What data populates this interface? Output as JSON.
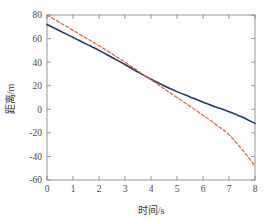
{
  "chart_data": {
    "type": "line",
    "title": "",
    "xlabel": "时间/s",
    "ylabel": "距离/m",
    "xlim": [
      0,
      8
    ],
    "ylim": [
      -60,
      80
    ],
    "xticks": [
      0,
      1,
      2,
      3,
      4,
      5,
      6,
      7,
      8
    ],
    "yticks": [
      -60,
      -40,
      -20,
      0,
      20,
      40,
      60,
      80
    ],
    "xtick_labels": [
      "0",
      "1",
      "2",
      "3",
      "4",
      "5",
      "6",
      "7",
      "8"
    ],
    "ytick_labels": [
      "-60",
      "-40",
      "-20",
      "0",
      "20",
      "40",
      "60",
      "80"
    ],
    "grid": false,
    "legend": "none",
    "crossing_point": {
      "x": 3.7,
      "y": 27
    },
    "series": [
      {
        "name": "blue-solid",
        "style": "solid",
        "color": "#1f3864",
        "width": 1.6,
        "x": [
          0,
          0.5,
          1,
          1.5,
          2,
          2.5,
          3,
          3.5,
          4,
          4.5,
          5,
          5.5,
          6,
          6.5,
          7,
          7.5,
          8
        ],
        "values": [
          72,
          66.5,
          61,
          55.5,
          50,
          44,
          38,
          31.5,
          25.5,
          20,
          15,
          10.5,
          6,
          2,
          -2,
          -6.5,
          -12
        ]
      },
      {
        "name": "red-dashed",
        "style": "dashed",
        "color": "#e06a42",
        "width": 1.3,
        "x": [
          0,
          0.5,
          1,
          1.5,
          2,
          2.5,
          3,
          3.5,
          4,
          4.5,
          5,
          5.5,
          6,
          6.5,
          7,
          7.5,
          8
        ],
        "values": [
          80,
          73.5,
          67,
          60.5,
          54,
          47,
          40,
          32.5,
          25,
          17.5,
          10,
          2.5,
          -5,
          -13,
          -21.5,
          -34,
          -48
        ]
      }
    ]
  },
  "axes": {
    "x_axis_label": "时间/s",
    "y_axis_label": "距离/m"
  },
  "colors": {
    "series_blue": "#1f3864",
    "series_red": "#e06a42",
    "frame": "#8a8a8a",
    "background": "#ffffff"
  }
}
